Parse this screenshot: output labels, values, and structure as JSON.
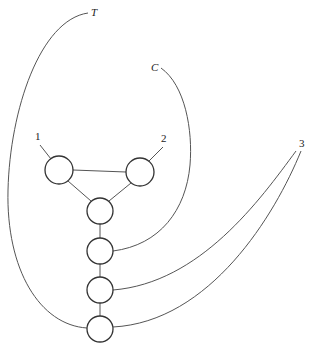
{
  "diagram": {
    "type": "graph",
    "nodes": [
      {
        "id": "n1",
        "label": "1",
        "cx": 59,
        "cy": 170,
        "r": 14,
        "label_x": 36,
        "label_y": 140
      },
      {
        "id": "n2",
        "label": "2",
        "cx": 140,
        "cy": 172,
        "r": 14,
        "label_x": 162,
        "label_y": 141
      },
      {
        "id": "n3",
        "label": "",
        "cx": 100,
        "cy": 211,
        "r": 13
      },
      {
        "id": "n4",
        "label": "",
        "cx": 100,
        "cy": 251,
        "r": 13
      },
      {
        "id": "n5",
        "label": "",
        "cx": 100,
        "cy": 290,
        "r": 13
      },
      {
        "id": "n6",
        "label": "",
        "cx": 100,
        "cy": 329,
        "r": 13
      }
    ],
    "terminals": [
      {
        "id": "T",
        "label": "T",
        "x": 92,
        "y": 15,
        "connects_to": "n6"
      },
      {
        "id": "C",
        "label": "C",
        "x": 152,
        "y": 70,
        "connects_to": "n4"
      },
      {
        "id": "3",
        "label": "3",
        "x": 299,
        "y": 146,
        "connects_to": [
          "n5",
          "n6"
        ]
      }
    ],
    "edges": [
      {
        "from": "n1",
        "to": "n2"
      },
      {
        "from": "n1",
        "to": "n3"
      },
      {
        "from": "n2",
        "to": "n3"
      },
      {
        "from": "n3",
        "to": "n4"
      },
      {
        "from": "n4",
        "to": "n5"
      },
      {
        "from": "n5",
        "to": "n6"
      },
      {
        "from": "label-1",
        "to": "n1"
      },
      {
        "from": "label-2",
        "to": "n2"
      },
      {
        "from": "T",
        "to": "n6"
      },
      {
        "from": "C",
        "to": "n4"
      },
      {
        "from": "3",
        "to": "n5"
      },
      {
        "from": "3",
        "to": "n6"
      }
    ]
  }
}
